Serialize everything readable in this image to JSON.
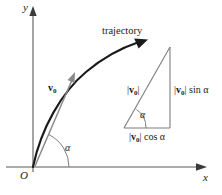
{
  "figure": {
    "background_color": "#ffffff",
    "ink_color": "#1a1a1a",
    "axis_color": "#8a8a8a",
    "width": 222,
    "height": 195
  },
  "axes": {
    "y_label": "y",
    "x_label": "x",
    "origin_label": "O",
    "origin_point": [
      33,
      167
    ],
    "y_axis_tip": [
      33,
      8
    ],
    "x_axis_tip": [
      206,
      167
    ]
  },
  "trajectory": {
    "label": "trajectory",
    "arrow_tip": [
      146,
      45
    ],
    "start_point": [
      33,
      167
    ]
  },
  "velocity_vector": {
    "label_magnitude": "v",
    "label_subscript": "0",
    "tail": [
      33,
      167
    ],
    "head": [
      74,
      76
    ]
  },
  "launch_angle": {
    "label": "α",
    "arc_radius": 36
  },
  "triangle": {
    "vertex_left": [
      124,
      128
    ],
    "vertex_right": [
      170,
      128
    ],
    "vertex_top": [
      170,
      47
    ],
    "angle_label": "α",
    "angle_arc_radius": 22,
    "hypotenuse_label": {
      "bar_open": "|",
      "vector": "v",
      "subscript": "0",
      "bar_close": "|",
      "suffix": ""
    },
    "opposite_label": {
      "bar_open": "|",
      "vector": "v",
      "subscript": "0",
      "bar_close": "|",
      "suffix": "sin α"
    },
    "adjacent_label": {
      "bar_open": "|",
      "vector": "v",
      "subscript": "0",
      "bar_close": "|",
      "suffix": "cos α"
    }
  }
}
